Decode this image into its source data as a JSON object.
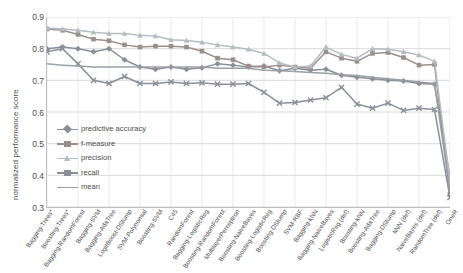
{
  "chart_data": {
    "type": "line",
    "title": "",
    "xlabel": "",
    "ylabel": "normalized performance score",
    "ylim": [
      0.3,
      0.9
    ],
    "yticks": [
      "0.3",
      "0.4",
      "0.5",
      "0.6",
      "0.7",
      "0.8",
      "0.9"
    ],
    "grid": true,
    "legend_position": "inside-lower-left",
    "categories": [
      "Bagging-Trees*",
      "Boosting-Trees*",
      "Bagging-RandomForest",
      "Bagging-SVM",
      "Bagging-AdaTree",
      "LogitBoost-DStump",
      "SVM-Polynomial",
      "Boosting-SVM",
      "C45",
      "RandomForest",
      "Bagging-LogisticReg",
      "Boosting-RandomForest",
      "MultilayerPerceptron",
      "Boosting-NaiveBayes",
      "Boosting-LogisticReg",
      "Boosting-DStump",
      "SVM-RBF",
      "Bagging-kNN",
      "Bagging-NaiveBayes",
      "LogisticReg (def)",
      "Boosting-kNN",
      "Boosting-AdaTree",
      "Bagging-DStump",
      "kNN (def)",
      "NaiveBayes (def)",
      "RandomTree (def)",
      "OneR"
    ],
    "series": [
      {
        "name": "predictive accuracy",
        "color": "#8a8f98",
        "marker": "diamond",
        "values": [
          0.8,
          0.805,
          0.8,
          0.79,
          0.8,
          0.765,
          0.742,
          0.735,
          0.742,
          0.735,
          0.74,
          0.752,
          0.748,
          0.742,
          0.745,
          0.73,
          0.738,
          0.732,
          0.735,
          0.716,
          0.71,
          0.705,
          0.7,
          0.698,
          0.69,
          0.688,
          0.392
        ]
      },
      {
        "name": "f-measure",
        "color": "#9a8f8a",
        "marker": "square",
        "values": [
          0.862,
          0.858,
          0.845,
          0.83,
          0.825,
          0.812,
          0.805,
          0.808,
          0.808,
          0.805,
          0.792,
          0.77,
          0.765,
          0.745,
          0.742,
          0.748,
          0.742,
          0.738,
          0.79,
          0.77,
          0.76,
          0.785,
          0.788,
          0.772,
          0.748,
          0.75,
          0.34
        ]
      },
      {
        "name": "precision",
        "color": "#b6bcc2",
        "marker": "triangle",
        "values": [
          0.865,
          0.862,
          0.858,
          0.852,
          0.848,
          0.848,
          0.842,
          0.84,
          0.828,
          0.826,
          0.82,
          0.812,
          0.805,
          0.798,
          0.785,
          0.755,
          0.742,
          0.745,
          0.805,
          0.782,
          0.77,
          0.8,
          0.798,
          0.79,
          0.78,
          0.76,
          0.382
        ]
      },
      {
        "name": "recall",
        "color": "#8a8f98",
        "marker": "x",
        "values": [
          0.79,
          0.8,
          0.752,
          0.7,
          0.69,
          0.712,
          0.69,
          0.69,
          0.695,
          0.69,
          0.692,
          0.688,
          0.688,
          0.69,
          0.662,
          0.628,
          0.63,
          0.638,
          0.645,
          0.678,
          0.625,
          0.612,
          0.628,
          0.605,
          0.612,
          0.608,
          0.33
        ]
      },
      {
        "name": "mean",
        "color": "#9aa0a6",
        "marker": "line",
        "values": [
          0.752,
          0.748,
          0.745,
          0.742,
          0.742,
          0.742,
          0.742,
          0.742,
          0.742,
          0.742,
          0.742,
          0.738,
          0.738,
          0.738,
          0.732,
          0.73,
          0.728,
          0.725,
          0.722,
          0.718,
          0.715,
          0.71,
          0.705,
          0.7,
          0.695,
          0.69,
          0.348
        ]
      }
    ]
  },
  "legend": {
    "items": [
      {
        "label": "predictive accuracy"
      },
      {
        "label": "f-measure"
      },
      {
        "label": "precision"
      },
      {
        "label": "recall"
      },
      {
        "label": "mean"
      }
    ]
  }
}
